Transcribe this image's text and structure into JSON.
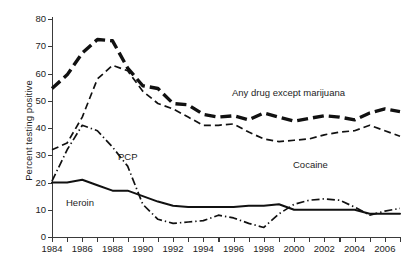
{
  "chart_data": {
    "type": "line",
    "title": "",
    "xlabel": "",
    "ylabel": "Percent testing positive",
    "xlim": [
      1984,
      2007
    ],
    "ylim": [
      0,
      80
    ],
    "grid": false,
    "legend_position": "inline-annotations",
    "x": [
      1984,
      1985,
      1986,
      1987,
      1988,
      1989,
      1990,
      1991,
      1992,
      1993,
      1994,
      1995,
      1996,
      1997,
      1998,
      1999,
      2000,
      2001,
      2002,
      2003,
      2004,
      2005,
      2006,
      2007
    ],
    "xticks": [
      "1984",
      "1986",
      "1988",
      "1990",
      "1992",
      "1994",
      "1996",
      "1998",
      "2000",
      "2002",
      "2004",
      "2006"
    ],
    "yticks": [
      "0",
      "10",
      "20",
      "30",
      "40",
      "50",
      "60",
      "70",
      "80"
    ],
    "series": [
      {
        "name": "Any drug except marijuana",
        "style": "thick-dashed",
        "color": "#111111",
        "values": [
          54.5,
          59.5,
          67.5,
          72.5,
          72.0,
          62.0,
          55.5,
          54.5,
          49.0,
          48.5,
          45.0,
          44.0,
          44.5,
          43.0,
          45.5,
          44.0,
          42.5,
          43.5,
          44.5,
          44.0,
          43.0,
          45.5,
          47.0,
          46.0
        ]
      },
      {
        "name": "Cocaine",
        "style": "thin-dashed",
        "color": "#111111",
        "values": [
          32.0,
          34.5,
          44.0,
          58.0,
          63.0,
          61.0,
          53.5,
          49.0,
          47.0,
          44.0,
          41.0,
          41.0,
          41.5,
          38.5,
          36.0,
          35.0,
          35.5,
          36.0,
          37.5,
          38.5,
          39.0,
          41.0,
          39.0,
          37.0
        ]
      },
      {
        "name": "PCP",
        "style": "dash-dot",
        "color": "#111111",
        "values": [
          20.5,
          32.0,
          41.0,
          39.0,
          33.0,
          26.0,
          12.0,
          6.5,
          5.0,
          5.5,
          6.0,
          8.0,
          7.0,
          5.0,
          3.5,
          8.5,
          12.0,
          13.5,
          14.0,
          13.5,
          11.0,
          8.0,
          9.5,
          10.5
        ]
      },
      {
        "name": "Heroin",
        "style": "solid",
        "color": "#111111",
        "values": [
          20.0,
          20.0,
          21.0,
          19.0,
          17.0,
          17.0,
          15.0,
          13.0,
          11.5,
          11.0,
          11.0,
          11.0,
          11.0,
          11.5,
          11.5,
          12.0,
          10.0,
          10.0,
          10.0,
          10.0,
          10.0,
          8.5,
          8.5,
          8.5
        ]
      }
    ],
    "annotations": [
      {
        "text": "Any drug except marijuana",
        "series": "Any drug except marijuana"
      },
      {
        "text": "Cocaine",
        "series": "Cocaine"
      },
      {
        "text": "PCP",
        "series": "PCP"
      },
      {
        "text": "Heroin",
        "series": "Heroin"
      }
    ]
  }
}
